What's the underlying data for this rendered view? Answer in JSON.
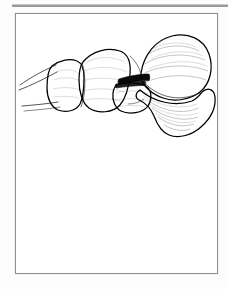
{
  "page": {
    "background_color": "#fdfdfd",
    "width": 228,
    "height": 289
  },
  "top_rule": {
    "name": "section-divider",
    "color": "#9a9a9c"
  },
  "figure": {
    "frame_border_color": "#8f9094",
    "panel_background": "#ffffff",
    "caption": "",
    "illustration": {
      "title": "",
      "alt_text": "",
      "type": "line-drawing",
      "subject": "great toe bones, lateral view",
      "ink_color": "#000000",
      "shading_color": "#3a3a3a",
      "fill_color": "#e8e8e8",
      "joint_space_color": "#0a0a0a",
      "parts": [
        {
          "name": "distal-phalanx",
          "label": ""
        },
        {
          "name": "proximal-phalanx",
          "label": ""
        },
        {
          "name": "sesamoid",
          "label": ""
        },
        {
          "name": "metatarsal-head",
          "label": ""
        },
        {
          "name": "metatarsal-shaft",
          "label": ""
        },
        {
          "name": "joint-space",
          "label": ""
        }
      ]
    }
  }
}
